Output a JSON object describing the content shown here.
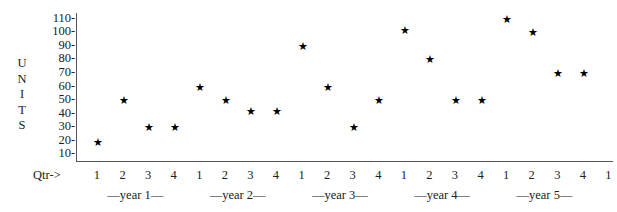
{
  "chart_data": {
    "type": "scatter",
    "title": "",
    "xlabel": "Qtr->",
    "ylabel": "UNITS",
    "ylim": [
      5,
      115
    ],
    "yticks": [
      110,
      100,
      90,
      80,
      70,
      60,
      50,
      40,
      30,
      20,
      10
    ],
    "grid": false,
    "legend": null,
    "marker": "star",
    "xtick_caption": "Qtr->",
    "categories": [
      "1",
      "2",
      "3",
      "4",
      "1",
      "2",
      "3",
      "4",
      "1",
      "2",
      "3",
      "4",
      "1",
      "2",
      "3",
      "4",
      "1",
      "2",
      "3",
      "4",
      "1"
    ],
    "group_labels": [
      "—year 1—",
      "—year 2—",
      "—year 3—",
      "—year 4—",
      "—year 5—"
    ],
    "points": [
      {
        "x_index": 0,
        "year": 1,
        "quarter": 1,
        "value": 19
      },
      {
        "x_index": 1,
        "year": 1,
        "quarter": 2,
        "value": 50
      },
      {
        "x_index": 2,
        "year": 1,
        "quarter": 3,
        "value": 30
      },
      {
        "x_index": 3,
        "year": 1,
        "quarter": 4,
        "value": 30
      },
      {
        "x_index": 4,
        "year": 2,
        "quarter": 1,
        "value": 60
      },
      {
        "x_index": 5,
        "year": 2,
        "quarter": 2,
        "value": 50
      },
      {
        "x_index": 6,
        "year": 2,
        "quarter": 3,
        "value": 42
      },
      {
        "x_index": 7,
        "year": 2,
        "quarter": 4,
        "value": 42
      },
      {
        "x_index": 8,
        "year": 3,
        "quarter": 1,
        "value": 90
      },
      {
        "x_index": 9,
        "year": 3,
        "quarter": 2,
        "value": 60
      },
      {
        "x_index": 10,
        "year": 3,
        "quarter": 3,
        "value": 30
      },
      {
        "x_index": 11,
        "year": 3,
        "quarter": 4,
        "value": 50
      },
      {
        "x_index": 12,
        "year": 4,
        "quarter": 1,
        "value": 102
      },
      {
        "x_index": 13,
        "year": 4,
        "quarter": 2,
        "value": 80
      },
      {
        "x_index": 14,
        "year": 4,
        "quarter": 3,
        "value": 50
      },
      {
        "x_index": 15,
        "year": 4,
        "quarter": 4,
        "value": 50
      },
      {
        "x_index": 16,
        "year": 5,
        "quarter": 1,
        "value": 110
      },
      {
        "x_index": 17,
        "year": 5,
        "quarter": 2,
        "value": 100
      },
      {
        "x_index": 18,
        "year": 5,
        "quarter": 3,
        "value": 70
      },
      {
        "x_index": 19,
        "year": 5,
        "quarter": 4,
        "value": 70
      }
    ],
    "marker_glyph": "★"
  },
  "axis": {
    "y_title_letters": [
      "U",
      "N",
      "I",
      "T",
      "S"
    ],
    "x_caption": "Qtr->"
  }
}
